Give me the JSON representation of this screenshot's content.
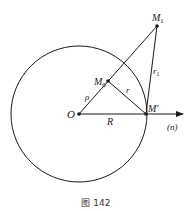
{
  "figure": {
    "caption": "图 142",
    "colors": {
      "stroke": "#1a1a1a",
      "background": "#ffffff"
    },
    "labels": {
      "O": "O",
      "M0": "M",
      "M0_sub": "0",
      "M1": "M",
      "M1_sub": "1",
      "Mprime": "M′",
      "rho": "ρ",
      "r": "r",
      "r1": "r",
      "r1_sub": "1",
      "R": "R",
      "n": "(n)"
    },
    "geometry": {
      "circle_center": [
        79,
        114
      ],
      "circle_radius": 68,
      "points": {
        "O": [
          79,
          114
        ],
        "M0": [
          108,
          81
        ],
        "M1": [
          157,
          26
        ],
        "Mprime": [
          146,
          114
        ]
      },
      "axis_arrow_end": [
        183,
        114
      ]
    }
  }
}
